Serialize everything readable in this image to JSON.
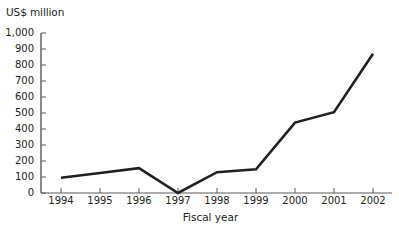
{
  "chart_data": {
    "type": "line",
    "title": "",
    "ylabel": "US$ million",
    "xlabel": "Fiscal year",
    "categories": [
      "1994",
      "1995",
      "1996",
      "1997",
      "1998",
      "1999",
      "2000",
      "2001",
      "2002"
    ],
    "values": [
      95,
      125,
      155,
      0,
      130,
      148,
      440,
      505,
      870
    ],
    "series": [
      {
        "name": "US$ million",
        "values": [
          95,
          125,
          155,
          0,
          130,
          148,
          440,
          505,
          870
        ]
      }
    ],
    "ylim": [
      0,
      1000
    ],
    "ytick_labels": [
      "1,000",
      "900",
      "800",
      "700",
      "600",
      "500",
      "400",
      "300",
      "200",
      "100",
      "0"
    ],
    "ytick_values": [
      1000,
      900,
      800,
      700,
      600,
      500,
      400,
      300,
      200,
      100,
      0
    ],
    "grid": false,
    "legend": "none",
    "line_color": "#231f20",
    "axis_color": "#58595b",
    "background_color": "#ffffff"
  }
}
